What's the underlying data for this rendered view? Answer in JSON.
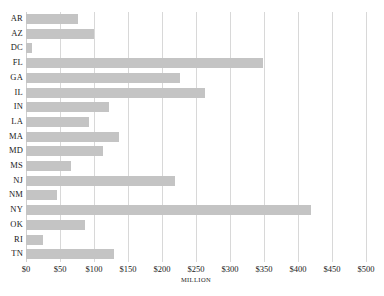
{
  "chart_data": {
    "type": "bar",
    "orientation": "horizontal",
    "title": "",
    "xlabel": "MILLION",
    "ylabel": "",
    "xlim": [
      0,
      500
    ],
    "xticks": [
      "$0",
      "$50",
      "$100",
      "$150",
      "$200",
      "$250",
      "$300",
      "$350",
      "$400",
      "$450",
      "$500"
    ],
    "xtick_values": [
      0,
      50,
      100,
      150,
      200,
      250,
      300,
      350,
      400,
      450,
      500
    ],
    "grid": "vertical",
    "legend": "none",
    "bar_color": "#c4c4c4",
    "gridline_color": "#d8d8d8",
    "categories": [
      "AR",
      "AZ",
      "DC",
      "FL",
      "GA",
      "IL",
      "IN",
      "LA",
      "MA",
      "MD",
      "MS",
      "NJ",
      "NM",
      "NY",
      "OK",
      "RI",
      "TN"
    ],
    "values": [
      77,
      100,
      9,
      348,
      226,
      263,
      122,
      93,
      137,
      113,
      66,
      219,
      45,
      419,
      87,
      25,
      130
    ]
  }
}
